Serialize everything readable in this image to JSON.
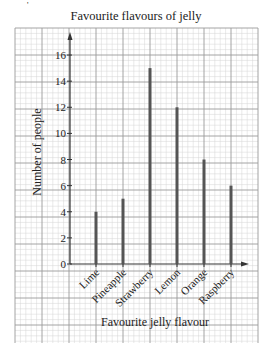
{
  "chart_data": {
    "type": "bar",
    "title": "Favourite flavours of jelly",
    "xlabel": "Favourite jelly flavour",
    "ylabel": "Number of people",
    "categories": [
      "Lime",
      "Pineapple",
      "Strawberry",
      "Lemon",
      "Orange",
      "Raspberry"
    ],
    "values": [
      4,
      5,
      15,
      12,
      8,
      6
    ],
    "ylim": [
      0,
      17
    ],
    "yticks": [
      0,
      2,
      4,
      6,
      8,
      10,
      12,
      14,
      16
    ],
    "grid": true,
    "grid_style": "graph paper (minor and major lines)",
    "bar_style": "thin vertical line bars",
    "legend": null
  },
  "colors": {
    "bar": "#555555",
    "axis": "#333333",
    "grid_major": "#9a9a9a",
    "grid_minor": "#d4d4d4",
    "text": "#222222"
  },
  "decoration": {
    "corner_mark": "'"
  }
}
